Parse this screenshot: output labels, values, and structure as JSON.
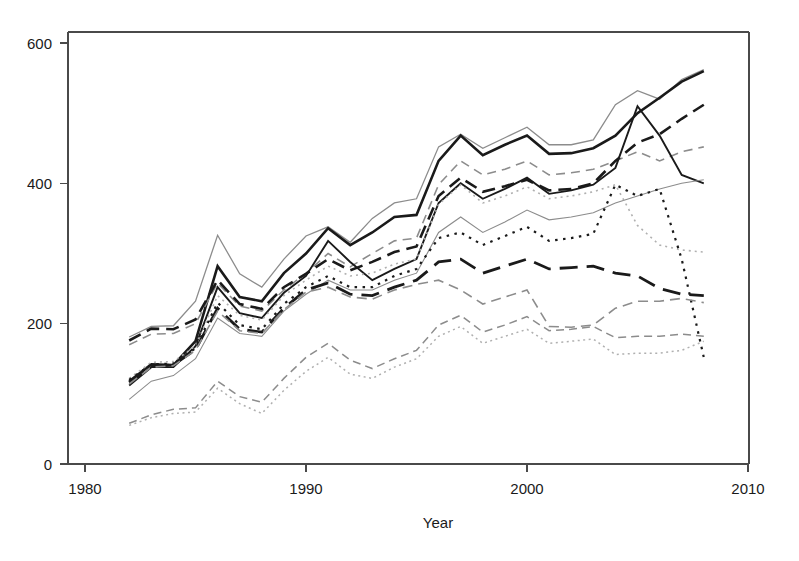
{
  "chart_data": {
    "type": "line",
    "title": "",
    "xlabel": "Year",
    "ylabel": "",
    "xlim": [
      1978.5,
      2010.8
    ],
    "ylim": [
      -22,
      625
    ],
    "grid": false,
    "legend": "none",
    "xticks": [
      1980,
      1990,
      2000,
      2010
    ],
    "xticklabels": [
      "1980",
      "1990",
      "2000",
      "2010"
    ],
    "yticks": [
      0,
      200,
      400,
      600
    ],
    "yticklabels": [
      "0",
      "200",
      "400",
      "600"
    ],
    "x": [
      1982,
      1983,
      1984,
      1985,
      1986,
      1987,
      1988,
      1989,
      1990,
      1991,
      1992,
      1993,
      1994,
      1995,
      1996,
      1997,
      1998,
      1999,
      2000,
      2001,
      2002,
      2003,
      2004,
      2005,
      2006,
      2007,
      2008
    ],
    "colors": {
      "black": "#1a1a1a",
      "gray": "#8c8c8c",
      "light_gray": "#b0b0b0",
      "axis": "#4a4a4a"
    },
    "series": [
      {
        "name": "series-1-gray-solid-top",
        "style": "solid",
        "color": "#8c8c8c",
        "width": 1.3,
        "dash": "none",
        "values": [
          181,
          196,
          197,
          232,
          326,
          271,
          252,
          292,
          325,
          338,
          316,
          350,
          372,
          378,
          452,
          470,
          450,
          465,
          480,
          455,
          455,
          462,
          512,
          532,
          520,
          548,
          562
        ]
      },
      {
        "name": "series-2-black-solid-top",
        "style": "solid",
        "color": "#1a1a1a",
        "width": 2.6,
        "dash": "none",
        "values": [
          118,
          142,
          141,
          175,
          282,
          238,
          232,
          272,
          300,
          336,
          312,
          330,
          352,
          355,
          432,
          468,
          440,
          455,
          468,
          442,
          443,
          450,
          468,
          500,
          522,
          545,
          560
        ]
      },
      {
        "name": "series-3-gray-dashed-upper",
        "style": "dashed",
        "color": "#8c8c8c",
        "width": 1.6,
        "dash": "9,6",
        "values": [
          170,
          185,
          186,
          200,
          258,
          225,
          218,
          248,
          272,
          300,
          281,
          300,
          318,
          322,
          398,
          432,
          412,
          420,
          432,
          412,
          415,
          420,
          432,
          445,
          432,
          445,
          452
        ]
      },
      {
        "name": "series-4-black-dashed-upper",
        "style": "dashed",
        "color": "#1a1a1a",
        "width": 2.6,
        "dash": "13,7",
        "values": [
          176,
          193,
          192,
          206,
          262,
          228,
          221,
          252,
          271,
          292,
          276,
          288,
          302,
          310,
          382,
          408,
          388,
          396,
          405,
          390,
          392,
          400,
          432,
          458,
          470,
          492,
          512
        ]
      },
      {
        "name": "series-5-black-solid-mid",
        "style": "solid",
        "color": "#1a1a1a",
        "width": 1.9,
        "dash": "none",
        "values": [
          112,
          138,
          138,
          168,
          252,
          215,
          208,
          244,
          268,
          318,
          288,
          262,
          278,
          292,
          372,
          400,
          378,
          392,
          408,
          385,
          390,
          398,
          422,
          510,
          468,
          412,
          400
        ]
      },
      {
        "name": "series-6-gray-solid-mid",
        "style": "solid",
        "color": "#8c8c8c",
        "width": 1.1,
        "dash": "none",
        "values": [
          92,
          118,
          126,
          150,
          208,
          186,
          182,
          218,
          242,
          262,
          248,
          248,
          262,
          272,
          330,
          352,
          330,
          345,
          362,
          348,
          352,
          358,
          372,
          382,
          392,
          400,
          405
        ]
      },
      {
        "name": "series-7-gray-dotted-mid",
        "style": "dotted",
        "color": "#b0b0b0",
        "width": 1.6,
        "dash": "2,4",
        "values": [
          122,
          145,
          146,
          168,
          240,
          212,
          205,
          240,
          262,
          282,
          268,
          272,
          285,
          292,
          370,
          398,
          372,
          382,
          395,
          378,
          382,
          388,
          398,
          340,
          312,
          305,
          302
        ]
      },
      {
        "name": "series-8-black-dotted-mid",
        "style": "dotted",
        "color": "#1a1a1a",
        "width": 2.2,
        "dash": "2.5,5.5",
        "values": [
          120,
          142,
          143,
          165,
          230,
          198,
          192,
          228,
          252,
          268,
          252,
          252,
          268,
          278,
          322,
          330,
          312,
          325,
          338,
          318,
          322,
          328,
          398,
          382,
          392,
          292,
          152
        ]
      },
      {
        "name": "series-9-black-longdash",
        "style": "longdash",
        "color": "#1a1a1a",
        "width": 2.8,
        "dash": "18,9",
        "values": [
          116,
          140,
          141,
          163,
          222,
          192,
          188,
          222,
          248,
          258,
          242,
          240,
          252,
          262,
          288,
          292,
          272,
          282,
          292,
          278,
          280,
          282,
          272,
          268,
          250,
          242,
          240
        ]
      },
      {
        "name": "series-10-gray-dashed-mid-low",
        "style": "dashed",
        "color": "#8c8c8c",
        "width": 1.6,
        "dash": "10,6",
        "values": [
          114,
          138,
          140,
          162,
          218,
          190,
          186,
          220,
          245,
          252,
          238,
          235,
          248,
          256,
          262,
          248,
          228,
          238,
          248,
          196,
          195,
          198,
          222,
          232,
          232,
          236,
          230
        ]
      },
      {
        "name": "series-11-gray-dashed-low",
        "style": "dashed",
        "color": "#8c8c8c",
        "width": 1.5,
        "dash": "8,5",
        "values": [
          58,
          70,
          78,
          80,
          118,
          96,
          88,
          122,
          152,
          172,
          148,
          136,
          150,
          162,
          198,
          212,
          188,
          198,
          210,
          190,
          192,
          196,
          180,
          182,
          182,
          185,
          182
        ]
      },
      {
        "name": "series-12-gray-dotted-low",
        "style": "dotted",
        "color": "#b0b0b0",
        "width": 1.5,
        "dash": "2,3.5",
        "values": [
          55,
          66,
          72,
          74,
          108,
          86,
          72,
          105,
          132,
          152,
          128,
          122,
          138,
          150,
          182,
          196,
          172,
          182,
          192,
          172,
          175,
          178,
          156,
          158,
          158,
          162,
          175
        ]
      }
    ]
  },
  "axes": {
    "y_labels": [
      "600",
      "400",
      "200",
      "0"
    ],
    "x_labels": [
      "1980",
      "1990",
      "2000",
      "2010"
    ],
    "x_title": "Year"
  }
}
